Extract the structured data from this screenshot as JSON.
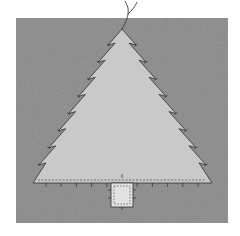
{
  "illustration": {
    "subject": "felt christmas tree sewing pattern",
    "colors": {
      "page_background": "#ffffff",
      "felt_background": "#8a8a8a",
      "tree_fill": "#c9c9c9",
      "trunk_fill": "#e2e2e2",
      "stitch_line": "#2e2e2e",
      "thread": "#3a3a3a"
    },
    "tree_tiers_per_side": 9,
    "base_stitch_marks": 11
  }
}
